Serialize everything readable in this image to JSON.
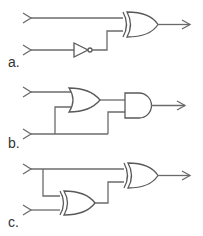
{
  "diagram": {
    "type": "logic-circuits",
    "colors": {
      "wire": "#6b6b6b",
      "gate": "#5a5a5a",
      "background": "#ffffff"
    },
    "circuits": [
      {
        "label": "a.",
        "inputs": 2,
        "gates": [
          "NOT",
          "XOR"
        ],
        "description": "Input 1 to XOR; Input 2 through NOT into XOR; XOR output"
      },
      {
        "label": "b.",
        "inputs": 2,
        "gates": [
          "OR",
          "AND"
        ],
        "description": "Input 1 and Input 2 into OR; OR output and Input 2 into AND; AND output"
      },
      {
        "label": "c.",
        "inputs": 2,
        "gates": [
          "XOR",
          "XOR"
        ],
        "description": "Input 1 and Input 2 into XOR; Input 1 and first XOR output into second XOR; output"
      }
    ]
  }
}
